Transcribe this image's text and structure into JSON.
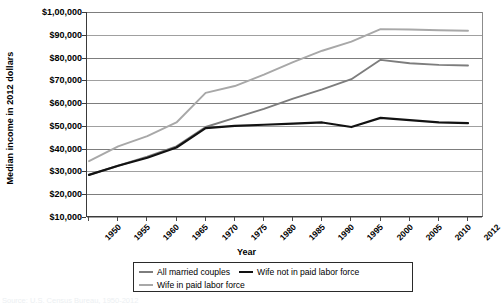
{
  "chart_data": {
    "type": "line",
    "title": "",
    "xlabel": "Year",
    "ylabel": "Median income in 2012 dollars",
    "categories": [
      1950,
      1955,
      1960,
      1965,
      1970,
      1975,
      1980,
      1985,
      1990,
      1995,
      2000,
      2005,
      2010,
      2012
    ],
    "x_tick_labels": [
      "1950",
      "1955",
      "1960",
      "1965",
      "1970",
      "1975",
      "1980",
      "1985",
      "1990",
      "1995",
      "2000",
      "2005",
      "2010",
      "2012"
    ],
    "y_tick_labels": [
      "$1,00,000",
      "$90,000",
      "$80,000",
      "$70,000",
      "$60,000",
      "$50,000",
      "$40,000",
      "$30,000",
      "$20,000",
      "$10,000"
    ],
    "y_tick_values": [
      100000,
      90000,
      80000,
      70000,
      60000,
      50000,
      40000,
      30000,
      20000,
      10000
    ],
    "ylim": [
      10000,
      100000
    ],
    "grid": true,
    "legend_position": "bottom",
    "series": [
      {
        "name": "All married couples",
        "color": "#7d7d7d",
        "width": 1.9,
        "values": [
          28500,
          32500,
          36500,
          41000,
          49500,
          53500,
          57500,
          62000,
          66000,
          70500,
          79000,
          77500,
          76800,
          76500
        ]
      },
      {
        "name": "Wife not in paid labor force",
        "color": "#121212",
        "width": 2.2,
        "values": [
          28500,
          32500,
          36000,
          40500,
          49000,
          50000,
          50500,
          51000,
          51500,
          49500,
          53500,
          52500,
          51500,
          51200
        ]
      },
      {
        "name": "Wife in paid labor force",
        "color": "#a8a8a8",
        "width": 1.9,
        "values": [
          34500,
          41000,
          45500,
          51500,
          64500,
          67500,
          72500,
          78000,
          83000,
          87000,
          92500,
          92300,
          92000,
          91800
        ]
      }
    ]
  },
  "legend": {
    "entries": [
      {
        "label": "All married couples",
        "color": "#7d7d7d",
        "width": 2
      },
      {
        "label": "Wife not in paid labor force",
        "color": "#121212",
        "width": 2.4
      },
      {
        "label": "Wife in paid labor force",
        "color": "#a8a8a8",
        "width": 2
      }
    ]
  },
  "caption": {
    "source_text": "Source: U.S. Census Bureau, 1950-2012"
  }
}
